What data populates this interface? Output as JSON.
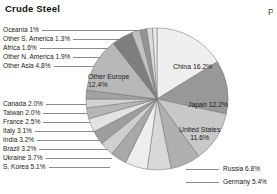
{
  "chart_data": {
    "type": "pie",
    "title": "Crude Steel",
    "unit": "%",
    "legend_position": "callout-labels",
    "slices": [
      {
        "label": "China",
        "value": 16.2,
        "display": "China 16.2%",
        "color": "#efefef",
        "placement": "inside"
      },
      {
        "label": "Japan",
        "value": 12.2,
        "display": "Japan 12.2%",
        "color": "#989898",
        "placement": "inside"
      },
      {
        "label": "United States",
        "value": 11.6,
        "display": "United States 11.6%",
        "color": "#c8c8c8",
        "placement": "inside"
      },
      {
        "label": "Russia",
        "value": 6.8,
        "display": "Russia 6.8%",
        "color": "#b0b0b0",
        "placement": "callout-right"
      },
      {
        "label": "Germany",
        "value": 5.4,
        "display": "Germany 5.4%",
        "color": "#d8d8d8",
        "placement": "callout-right"
      },
      {
        "label": "S. Korea",
        "value": 5.1,
        "display": "S. Korea 5.1%",
        "color": "#ededed",
        "placement": "callout-left"
      },
      {
        "label": "Ukraine",
        "value": 3.7,
        "display": "Ukraine 3.7%",
        "color": "#a8a8a8",
        "placement": "callout-left"
      },
      {
        "label": "Brazil",
        "value": 3.2,
        "display": "Brazil 3.2%",
        "color": "#cfcfcf",
        "placement": "callout-left"
      },
      {
        "label": "India",
        "value": 3.2,
        "display": "India 3.2%",
        "color": "#9e9e9e",
        "placement": "callout-left"
      },
      {
        "label": "Italy",
        "value": 3.1,
        "display": "Italy 3.1%",
        "color": "#e2e2e2",
        "placement": "callout-left"
      },
      {
        "label": "France",
        "value": 2.5,
        "display": "France 2.5%",
        "color": "#b6b6b6",
        "placement": "callout-left"
      },
      {
        "label": "Taiwan",
        "value": 2.0,
        "display": "Taiwan 2.0%",
        "color": "#d2d2d2",
        "placement": "callout-left"
      },
      {
        "label": "Canada",
        "value": 2.0,
        "display": "Canada 2.0%",
        "color": "#a2a2a2",
        "placement": "callout-left"
      },
      {
        "label": "Other Europe",
        "value": 12.4,
        "display": "Other Europe 12.4%",
        "color": "#b8b8b8",
        "placement": "inside"
      },
      {
        "label": "Other Asia",
        "value": 4.8,
        "display": "Other Asia 4.8%",
        "color": "#7e7e7e",
        "placement": "callout-left"
      },
      {
        "label": "Other N. America",
        "value": 1.9,
        "display": "Other N. America 1.9%",
        "color": "#c0c0c0",
        "placement": "callout-left"
      },
      {
        "label": "Africa",
        "value": 1.6,
        "display": "Africa 1.6%",
        "color": "#949494",
        "placement": "callout-left"
      },
      {
        "label": "Other S. America",
        "value": 1.3,
        "display": "Other S. America 1.3%",
        "color": "#dcdcdc",
        "placement": "callout-left"
      },
      {
        "label": "Oceania",
        "value": 1.0,
        "display": "Oceania 1%",
        "color": "#eaeaea",
        "placement": "callout-left"
      }
    ]
  },
  "header": {
    "title": "Crude Steel",
    "edge_partial_glyph": "P"
  },
  "left_labels": [
    "Oceania 1%",
    "Other S. America 1.3%",
    "Africa 1.6%",
    "Other N. America 1.9%",
    "Other Asia 4.8%",
    "Canada 2.0%",
    "Taiwan 2.0%",
    "France 2.5%",
    "Italy 3.1%",
    "India 3.2%",
    "Brazil 3.2%",
    "Ukraine 3.7%",
    "S. Korea 5.1%"
  ],
  "inside_labels": {
    "other_europe_name": "Other Europe",
    "other_europe_value": "12.4%",
    "china": "China 16.2%",
    "japan": "Japan 12.2%",
    "us_name": "United States",
    "us_value": "11.6%"
  },
  "right_labels": [
    "Russia 6.8%",
    "Germany 5.4%"
  ],
  "style": {
    "background": "#ffffff",
    "text_color": "#1a1a1a",
    "leader_line_color": "#8a8a8a",
    "slice_outline": "#6f6f6f"
  }
}
